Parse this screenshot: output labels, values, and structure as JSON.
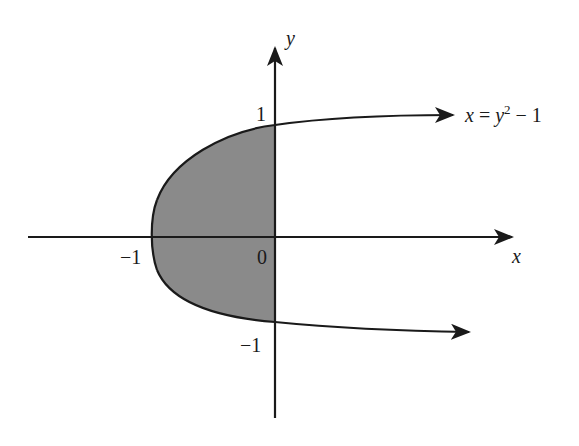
{
  "diagram": {
    "curve_label_x": "x",
    "curve_label_eq": "=",
    "curve_label_y": "y",
    "curve_label_exp": "2",
    "curve_label_rest": "− 1",
    "x_axis_label": "x",
    "y_axis_label": "y",
    "tick_labels": {
      "x_neg1": "−1",
      "origin": "0",
      "y_pos1": "1",
      "y_neg1": "−1"
    },
    "colors": {
      "axis": "#1a1a1a",
      "curve": "#1a1a1a",
      "shaded_region": "#8a8a8a",
      "background": "#ffffff"
    },
    "shaded_region": "between parabola x = y^2 - 1 and x = 0 for -1 ≤ y ≤ 1"
  }
}
